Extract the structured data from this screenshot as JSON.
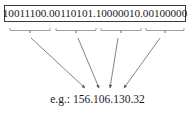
{
  "figure": {
    "name": "ip-address-binary-to-dotted-decimal-diagram",
    "background_color": "#ffffff",
    "width": 195,
    "height": 116
  },
  "binary_box": {
    "border_color": "#3a3a3a",
    "text_color": "#1a1a1a",
    "full_binary": "10011100.00110101.10000010.00100000",
    "octets": [
      {
        "binary": "10011100",
        "decimal": "156"
      },
      {
        "binary": "00110101",
        "decimal": "106"
      },
      {
        "binary": "10000010",
        "decimal": "130"
      },
      {
        "binary": "00100000",
        "decimal": "32"
      }
    ]
  },
  "braces": {
    "count": 4,
    "color": "#8a8a8a",
    "items": [
      {
        "label": "brace-octet-1"
      },
      {
        "label": "brace-octet-2"
      },
      {
        "label": "brace-octet-3"
      },
      {
        "label": "brace-octet-4"
      }
    ]
  },
  "arrows": {
    "count": 4,
    "color": "#6e6e6e",
    "items": [
      {
        "label": "arrow-octet-1"
      },
      {
        "label": "arrow-octet-2"
      },
      {
        "label": "arrow-octet-3"
      },
      {
        "label": "arrow-octet-4"
      }
    ]
  },
  "caption": {
    "text": "e.g.: 156.106.130.32",
    "color": "#1a1a1a"
  }
}
